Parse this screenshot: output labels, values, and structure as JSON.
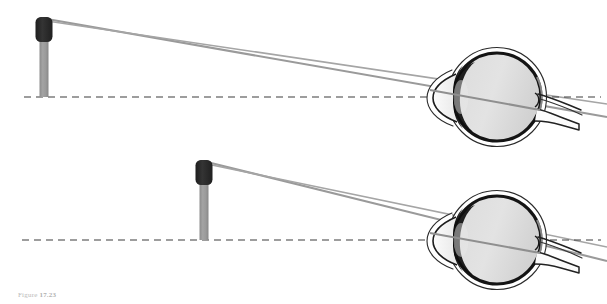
{
  "figure": {
    "caption_label": "Figure",
    "caption_number": "17.23",
    "background_color": "#ffffff"
  },
  "colors": {
    "ray": "#9a9a9a",
    "axis_dashed": "#4a4a4a",
    "pole_stem": "#9c9c9c",
    "pole_stem_shade": "#8a8a8a",
    "pole_top": "#2b2b2b",
    "eye_outline": "#1a1a1a",
    "eye_sclera": "#ffffff",
    "eye_vitreous_light": "#e6e6e6",
    "eye_vitreous_dark": "#c9c9c9",
    "iris_dark": "#111111",
    "cornea_fill": "#f2f2f2",
    "optic_nerve": "#f5f5f5"
  },
  "panels": [
    {
      "id": "panel-top",
      "name": "far-object-panel",
      "object": {
        "name": "pole-object",
        "x": 44,
        "top_y": 17,
        "base_y": 97,
        "stem_width": 9,
        "head_width": 17,
        "head_height": 25
      },
      "optical_axis": {
        "name": "optical-axis-dashed-line",
        "y": 97,
        "x_start": 24,
        "x_end": 600,
        "dash": "7 5"
      },
      "rays": [
        {
          "name": "chief-ray-upper",
          "x1": 47,
          "y1": 19,
          "x2": 607,
          "y2": 116
        },
        {
          "name": "chief-ray-lower",
          "x1": 47,
          "y1": 21,
          "x2": 607,
          "y2": 104
        }
      ],
      "eye": {
        "name": "eye-diagram",
        "center_x": 492,
        "center_y": 97,
        "radius": 45
      }
    },
    {
      "id": "panel-bottom",
      "name": "near-object-panel",
      "object": {
        "name": "pole-object",
        "x": 204,
        "top_y": 160,
        "base_y": 240,
        "stem_width": 9,
        "head_width": 17,
        "head_height": 25
      },
      "optical_axis": {
        "name": "optical-axis-dashed-line",
        "y": 240,
        "x_start": 22,
        "x_end": 600,
        "dash": "7 5"
      },
      "rays": [
        {
          "name": "chief-ray-upper",
          "x1": 207,
          "y1": 162,
          "x2": 607,
          "y2": 259
        },
        {
          "name": "chief-ray-lower",
          "x1": 207,
          "y1": 164,
          "x2": 607,
          "y2": 247
        }
      ],
      "eye": {
        "name": "eye-diagram",
        "center_x": 492,
        "center_y": 240,
        "radius": 45
      }
    }
  ]
}
